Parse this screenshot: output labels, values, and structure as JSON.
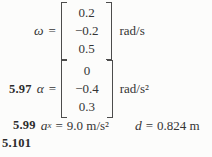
{
  "page": {
    "background_color": "#fcfcfb",
    "text_color": "#343434",
    "bracket_color": "#4c4c4c"
  },
  "equations": [
    {
      "problem": "",
      "symbol": "ω",
      "equals": "=",
      "vector": [
        "0.2",
        "−0.2",
        "0.5"
      ],
      "unit": "rad/s"
    },
    {
      "problem": "5.97",
      "symbol": "α",
      "equals": "=",
      "vector": [
        "0",
        "−0.4",
        "0.3"
      ],
      "unit": "rad/s²"
    }
  ],
  "answer_599": {
    "problem": "5.99",
    "var1": "a",
    "var1_sub": "x",
    "eq1": "=",
    "val1": "9.0 m/s²",
    "var2": "d",
    "eq2": "=",
    "val2": "0.824 m"
  },
  "answer_5101": {
    "problem": "5.101"
  }
}
